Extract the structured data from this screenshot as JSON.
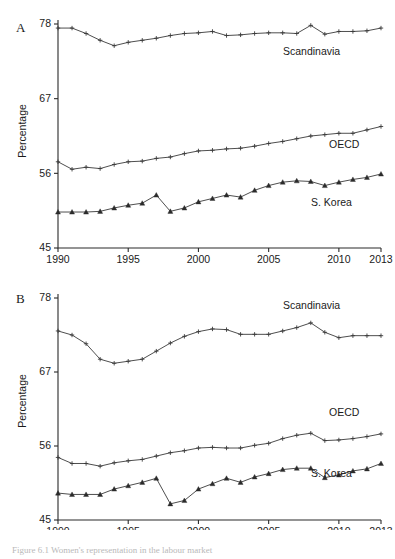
{
  "figure": {
    "caption": "Figure 6.1  Women's representation in the labour market"
  },
  "panels": [
    {
      "id": "A",
      "letter": "A",
      "ylabel": "Percentage"
    },
    {
      "id": "B",
      "letter": "B",
      "ylabel": "Percentage"
    }
  ],
  "chart_data": [
    {
      "type": "line",
      "title": "A",
      "xlabel": "",
      "ylabel": "Percentage",
      "xlim": [
        1990,
        2013
      ],
      "ylim": [
        45,
        78
      ],
      "yticks": [
        45,
        56,
        67,
        78
      ],
      "xticks": [
        1990,
        1995,
        2000,
        2005,
        2010,
        2013
      ],
      "grid": false,
      "legend_position": "inline-right",
      "x": [
        1990,
        1991,
        1992,
        1993,
        1994,
        1995,
        1996,
        1997,
        1998,
        1999,
        2000,
        2001,
        2002,
        2003,
        2004,
        2005,
        2006,
        2007,
        2008,
        2009,
        2010,
        2011,
        2012,
        2013
      ],
      "series": [
        {
          "name": "Scandinavia",
          "marker": "plus",
          "values": [
            77.4,
            77.4,
            76.6,
            75.6,
            74.8,
            75.3,
            75.6,
            75.9,
            76.3,
            76.6,
            76.7,
            76.9,
            76.3,
            76.4,
            76.6,
            76.7,
            76.7,
            76.6,
            77.8,
            76.5,
            76.9,
            76.9,
            77.0,
            77.4
          ]
        },
        {
          "name": "OECD",
          "marker": "plus",
          "values": [
            57.7,
            56.6,
            56.9,
            56.7,
            57.3,
            57.7,
            57.8,
            58.2,
            58.4,
            58.9,
            59.3,
            59.4,
            59.6,
            59.7,
            60.0,
            60.4,
            60.7,
            61.1,
            61.5,
            61.7,
            61.9,
            61.9,
            62.4,
            62.9
          ]
        },
        {
          "name": "S. Korea",
          "marker": "triangle",
          "values": [
            50.3,
            50.3,
            50.3,
            50.4,
            50.9,
            51.3,
            51.6,
            52.8,
            50.4,
            50.9,
            51.8,
            52.3,
            52.8,
            52.5,
            53.5,
            54.2,
            54.7,
            54.9,
            54.8,
            54.2,
            54.7,
            55.1,
            55.4,
            55.9
          ]
        }
      ]
    },
    {
      "type": "line",
      "title": "B",
      "xlabel": "",
      "ylabel": "Percentage",
      "xlim": [
        1990,
        2013
      ],
      "ylim": [
        45,
        78
      ],
      "yticks": [
        45,
        56,
        67,
        78
      ],
      "xticks": [
        1990,
        1995,
        2000,
        2005,
        2010,
        2013
      ],
      "grid": false,
      "legend_position": "inline-right",
      "x": [
        1990,
        1991,
        1992,
        1993,
        1994,
        1995,
        1996,
        1997,
        1998,
        1999,
        2000,
        2001,
        2002,
        2003,
        2004,
        2005,
        2006,
        2007,
        2008,
        2009,
        2010,
        2011,
        2012,
        2013
      ],
      "series": [
        {
          "name": "Scandinavia",
          "marker": "plus",
          "values": [
            73.1,
            72.5,
            71.2,
            68.9,
            68.3,
            68.6,
            68.9,
            70.1,
            71.3,
            72.3,
            73.0,
            73.4,
            73.3,
            72.6,
            72.6,
            72.6,
            73.1,
            73.6,
            74.3,
            72.9,
            72.1,
            72.4,
            72.4,
            72.4
          ]
        },
        {
          "name": "OECD",
          "marker": "plus",
          "values": [
            54.3,
            53.4,
            53.4,
            53.0,
            53.5,
            53.8,
            54.0,
            54.5,
            55.0,
            55.3,
            55.7,
            55.8,
            55.7,
            55.7,
            56.1,
            56.4,
            57.1,
            57.6,
            57.9,
            56.8,
            56.9,
            57.1,
            57.4,
            57.8
          ]
        },
        {
          "name": "S. Korea",
          "marker": "triangle",
          "values": [
            49.0,
            48.8,
            48.8,
            48.8,
            49.6,
            50.1,
            50.6,
            51.2,
            47.4,
            47.9,
            49.6,
            50.4,
            51.2,
            50.6,
            51.4,
            51.9,
            52.5,
            52.7,
            52.7,
            51.3,
            51.7,
            52.3,
            52.6,
            53.4
          ]
        }
      ]
    }
  ]
}
